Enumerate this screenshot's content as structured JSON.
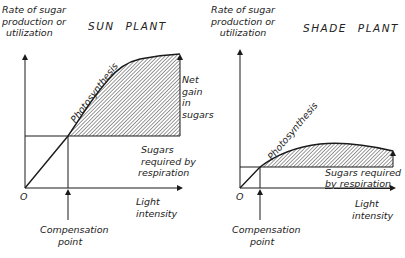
{
  "sun_panel": {
    "title": "SUN PLANT",
    "y_axis_label": [
      "Rate of sugar",
      "production or",
      "utilization"
    ],
    "x_axis_label": [
      "Light",
      "intensity"
    ],
    "origin_label": "O",
    "curve_label": "Photosynthesis",
    "net_gain_label": [
      "Net",
      "gain",
      "in",
      "sugars"
    ],
    "respiration_label": [
      "Sugars",
      "required by",
      "respiration"
    ],
    "compensation_label": [
      "Compensation",
      "point"
    ]
  },
  "shade_panel": {
    "title": "SHADE PLANT",
    "y_axis_label": [
      "Rate of sugar",
      "production or",
      "utilization"
    ],
    "x_axis_label": [
      "Light",
      "intensity"
    ],
    "origin_label": "O",
    "curve_label": "Photosynthesis",
    "respiration_label": [
      "Sugars required",
      "by respiration"
    ],
    "compensation_label": [
      "Compensation",
      "point"
    ]
  },
  "colors": {
    "line": "#1a1a1a",
    "hatch": "#333333",
    "background": "#ffffff"
  }
}
